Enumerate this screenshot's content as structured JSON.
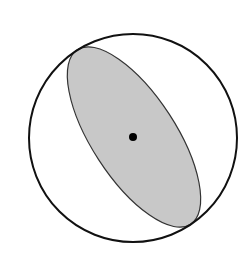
{
  "diagram": {
    "type": "geometric-figure",
    "colors": {
      "background": "#ffffff",
      "circle_stroke": "#111111",
      "ellipse_fill": "#c8c8c8",
      "ellipse_stroke": "#333333",
      "dot": "#000000"
    },
    "circle": {
      "cx": 133,
      "cy": 138,
      "r": 104
    },
    "ellipse": {
      "cx": 134,
      "cy": 137,
      "rx": 104,
      "ry": 42,
      "rotation_deg": 57
    },
    "center_dot": {
      "cx": 133,
      "cy": 137,
      "r": 4
    }
  }
}
